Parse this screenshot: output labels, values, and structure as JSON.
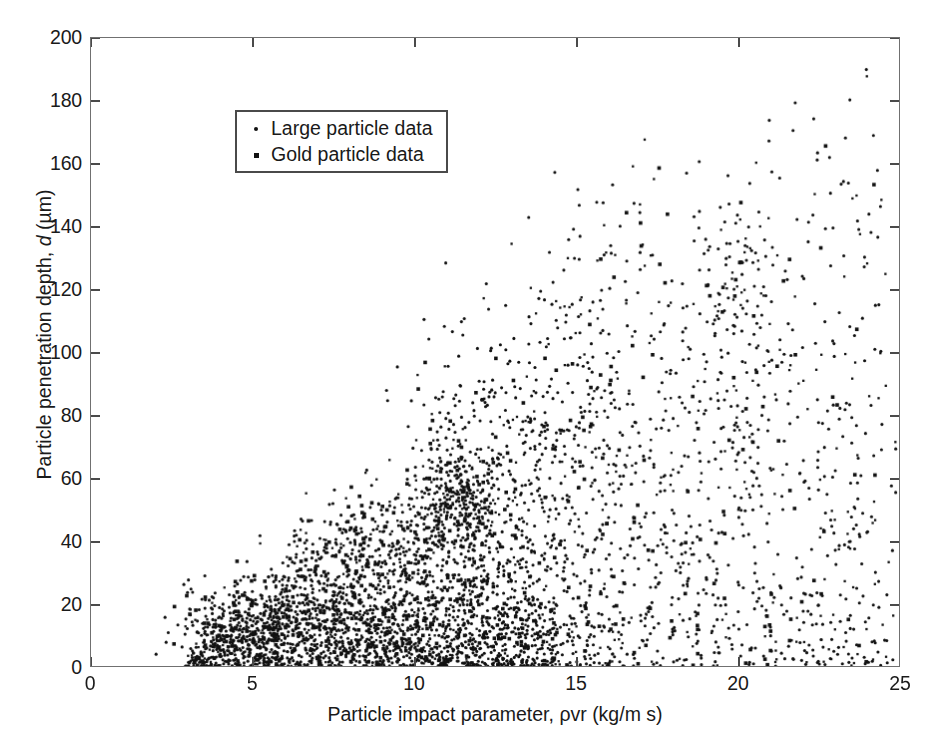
{
  "chart_data": {
    "type": "scatter",
    "title": "",
    "xlabel": "Particle impact parameter, ρvr (kg/m s)",
    "ylabel": "Particle penetration depth, d (µm)",
    "xlabel_parts": {
      "prefix": "Particle impact parameter, ",
      "rho": "ρ",
      "mid": "vr (kg/m s)"
    },
    "ylabel_parts": {
      "prefix": "Particle penetration depth, ",
      "symbol": "d",
      "suffix": " (µm)"
    },
    "xlim": [
      0,
      25
    ],
    "ylim": [
      0,
      200
    ],
    "xticks": [
      0,
      5,
      10,
      15,
      20,
      25
    ],
    "yticks": [
      0,
      20,
      40,
      60,
      80,
      100,
      120,
      140,
      160,
      180,
      200
    ],
    "xticklabels": [
      "0",
      "5",
      "10",
      "15",
      "20",
      "25"
    ],
    "yticklabels": [
      "0",
      "20",
      "40",
      "60",
      "80",
      "100",
      "120",
      "140",
      "160",
      "180",
      "200"
    ],
    "grid": false,
    "box": true,
    "tick_direction": "in",
    "legend": {
      "position": "upper-left-inside",
      "entries": [
        {
          "label": "Large particle data",
          "marker": "dot",
          "color": "#111111"
        },
        {
          "label": "Gold particle data",
          "marker": "square",
          "color": "#111111"
        }
      ]
    },
    "marker_color": "#111111",
    "marker_size_px": 3,
    "point_count_approx": 2600,
    "clusters": [
      {
        "cx": 4.3,
        "cy": 10,
        "sx": 0.9,
        "sy": 7,
        "n": 300,
        "rot": 0.0
      },
      {
        "cx": 5.6,
        "cy": 14,
        "sx": 0.9,
        "sy": 9,
        "n": 180,
        "rot": 0.1
      },
      {
        "cx": 6.8,
        "cy": 22,
        "sx": 1.0,
        "sy": 12,
        "n": 200,
        "rot": 0.15
      },
      {
        "cx": 8.0,
        "cy": 25,
        "sx": 1.1,
        "sy": 14,
        "n": 230,
        "rot": 0.15
      },
      {
        "cx": 9.2,
        "cy": 28,
        "sx": 1.1,
        "sy": 16,
        "n": 230,
        "rot": 0.15
      },
      {
        "cx": 10.3,
        "cy": 33,
        "sx": 1.1,
        "sy": 19,
        "n": 230,
        "rot": 0.18
      },
      {
        "cx": 11.3,
        "cy": 55,
        "sx": 0.62,
        "sy": 9,
        "n": 230,
        "rot": 0.0
      },
      {
        "cx": 11.4,
        "cy": 30,
        "sx": 1.0,
        "sy": 18,
        "n": 200,
        "rot": 0.15
      },
      {
        "cx": 12.4,
        "cy": 38,
        "sx": 1.1,
        "sy": 22,
        "n": 170,
        "rot": 0.2
      },
      {
        "cx": 13.3,
        "cy": 40,
        "sx": 1.0,
        "sy": 24,
        "n": 120,
        "rot": 0.2
      },
      {
        "cx": 14.5,
        "cy": 70,
        "sx": 0.75,
        "sy": 30,
        "n": 110,
        "rot": 0.0
      },
      {
        "cx": 15.3,
        "cy": 52,
        "sx": 1.0,
        "sy": 28,
        "n": 90,
        "rot": 0.2
      },
      {
        "cx": 16.6,
        "cy": 48,
        "sx": 1.1,
        "sy": 28,
        "n": 70,
        "rot": 0.2
      },
      {
        "cx": 17.8,
        "cy": 50,
        "sx": 1.1,
        "sy": 30,
        "n": 60,
        "rot": 0.2
      },
      {
        "cx": 19.0,
        "cy": 55,
        "sx": 1.0,
        "sy": 32,
        "n": 55,
        "rot": 0.2
      },
      {
        "cx": 20.0,
        "cy": 85,
        "sx": 0.85,
        "sy": 32,
        "n": 110,
        "rot": 0.0
      },
      {
        "cx": 20.1,
        "cy": 122,
        "sx": 0.7,
        "sy": 15,
        "n": 50,
        "rot": 0.0
      },
      {
        "cx": 21.3,
        "cy": 55,
        "sx": 1.0,
        "sy": 30,
        "n": 50,
        "rot": 0.2
      },
      {
        "cx": 22.5,
        "cy": 52,
        "sx": 1.0,
        "sy": 30,
        "n": 45,
        "rot": 0.2
      },
      {
        "cx": 23.6,
        "cy": 48,
        "sx": 0.9,
        "sy": 28,
        "n": 40,
        "rot": 0.2
      },
      {
        "cx": 24.4,
        "cy": 45,
        "sx": 0.6,
        "sy": 26,
        "n": 30,
        "rot": 0.2
      },
      {
        "cx": 7.5,
        "cy": 8,
        "sx": 2.2,
        "sy": 5,
        "n": 150,
        "rot": 0.0
      },
      {
        "cx": 10.5,
        "cy": 8,
        "sx": 2.2,
        "sy": 5,
        "n": 120,
        "rot": 0.0
      },
      {
        "cx": 13.5,
        "cy": 10,
        "sx": 2.0,
        "sy": 7,
        "n": 70,
        "rot": 0.0
      },
      {
        "cx": 17.0,
        "cy": 12,
        "sx": 2.2,
        "sy": 8,
        "n": 45,
        "rot": 0.0
      },
      {
        "cx": 21.0,
        "cy": 14,
        "sx": 2.2,
        "sy": 9,
        "n": 35,
        "rot": 0.0
      },
      {
        "cx": 15.0,
        "cy": 110,
        "sx": 1.2,
        "sy": 18,
        "n": 35,
        "rot": 0.0
      },
      {
        "cx": 12.0,
        "cy": 90,
        "sx": 1.2,
        "sy": 18,
        "n": 40,
        "rot": 0.0
      },
      {
        "cx": 18.5,
        "cy": 100,
        "sx": 1.6,
        "sy": 25,
        "n": 30,
        "rot": 0.1
      },
      {
        "cx": 22.0,
        "cy": 110,
        "sx": 1.6,
        "sy": 28,
        "n": 25,
        "rot": 0.1
      },
      {
        "cx": 20.5,
        "cy": 150,
        "sx": 1.4,
        "sy": 14,
        "n": 22,
        "rot": 0.0
      },
      {
        "cx": 16.0,
        "cy": 140,
        "sx": 1.4,
        "sy": 14,
        "n": 10,
        "rot": 0.0
      }
    ]
  }
}
